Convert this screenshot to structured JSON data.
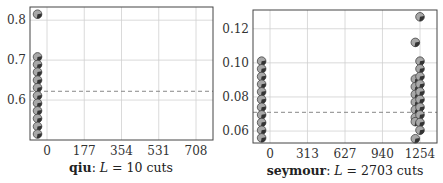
{
  "chart_data": [
    {
      "type": "scatter",
      "title": "",
      "caption": {
        "name": "qiu",
        "sep": ": ",
        "var": "L",
        "eq": " = ",
        "value": "10",
        "unit": " cuts"
      },
      "xlabel": "",
      "ylabel": "",
      "x_ticks": [
        "0",
        "177",
        "354",
        "531",
        "708"
      ],
      "y_ticks": [
        "0.6",
        "0.7",
        "0.8"
      ],
      "xlim": [
        -50,
        850
      ],
      "ylim": [
        0.5,
        0.833
      ],
      "grid": true,
      "reference_line": {
        "style": "dashed",
        "y": 0.622
      },
      "marker": "pie-circle",
      "points": [
        {
          "x": -45,
          "y": 0.815
        },
        {
          "x": -45,
          "y": 0.708
        },
        {
          "x": -45,
          "y": 0.689
        },
        {
          "x": -45,
          "y": 0.67
        },
        {
          "x": -45,
          "y": 0.65
        },
        {
          "x": -45,
          "y": 0.631
        },
        {
          "x": -45,
          "y": 0.611
        },
        {
          "x": -45,
          "y": 0.592
        },
        {
          "x": -45,
          "y": 0.573
        },
        {
          "x": -45,
          "y": 0.554
        },
        {
          "x": -45,
          "y": 0.534
        },
        {
          "x": -45,
          "y": 0.515
        }
      ]
    },
    {
      "type": "scatter",
      "title": "",
      "caption": {
        "name": "seymour",
        "sep": ": ",
        "var": "L",
        "eq": " = ",
        "value": "2703",
        "unit": " cuts"
      },
      "xlabel": "",
      "ylabel": "",
      "x_ticks": [
        "0",
        "313",
        "627",
        "940",
        "1254"
      ],
      "y_ticks": [
        "0.06",
        "0.08",
        "0.10",
        "0.12"
      ],
      "xlim": [
        -135,
        1350
      ],
      "ylim": [
        0.053,
        0.131
      ],
      "grid": true,
      "reference_line": {
        "style": "dashed",
        "y": 0.071
      },
      "marker": "pie-circle",
      "points": [
        {
          "x": -70,
          "y": 0.101
        },
        {
          "x": -70,
          "y": 0.0965
        },
        {
          "x": -70,
          "y": 0.092
        },
        {
          "x": -70,
          "y": 0.0875
        },
        {
          "x": -70,
          "y": 0.083
        },
        {
          "x": -70,
          "y": 0.0785
        },
        {
          "x": -70,
          "y": 0.074
        },
        {
          "x": -70,
          "y": 0.0695
        },
        {
          "x": -70,
          "y": 0.065
        },
        {
          "x": -70,
          "y": 0.0605
        },
        {
          "x": -70,
          "y": 0.056
        },
        {
          "x": 1215,
          "y": 0.112
        },
        {
          "x": 1215,
          "y": 0.0905
        },
        {
          "x": 1215,
          "y": 0.086
        },
        {
          "x": 1215,
          "y": 0.0815
        },
        {
          "x": 1215,
          "y": 0.077
        },
        {
          "x": 1215,
          "y": 0.0725
        },
        {
          "x": 1215,
          "y": 0.068
        },
        {
          "x": 1215,
          "y": 0.0655
        },
        {
          "x": 1215,
          "y": 0.0555
        },
        {
          "x": 1254,
          "y": 0.127
        },
        {
          "x": 1254,
          "y": 0.101
        },
        {
          "x": 1254,
          "y": 0.0965
        },
        {
          "x": 1254,
          "y": 0.092
        },
        {
          "x": 1254,
          "y": 0.0875
        },
        {
          "x": 1254,
          "y": 0.083
        },
        {
          "x": 1254,
          "y": 0.0785
        },
        {
          "x": 1254,
          "y": 0.074
        },
        {
          "x": 1254,
          "y": 0.0695
        },
        {
          "x": 1254,
          "y": 0.065
        },
        {
          "x": 1254,
          "y": 0.0605
        }
      ]
    }
  ],
  "colors": {
    "frame": "#444444",
    "grid": "#d0d0d0",
    "dash": "#888888",
    "marker_fill": "#a8a8a8",
    "marker_wedge": "#333333",
    "marker_stroke": "#444444"
  },
  "layout": [
    {
      "frame": [
        30,
        7,
        213,
        140
      ],
      "xpix": [
        47,
        196
      ],
      "caption_x": 121
    },
    {
      "frame": [
        253,
        10,
        437,
        143
      ],
      "xpix": [
        270,
        420
      ],
      "caption_x": 345
    }
  ]
}
